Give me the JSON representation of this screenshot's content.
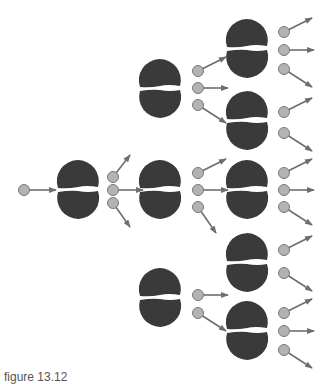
{
  "figure": {
    "caption": "figure 13.12",
    "colors": {
      "nucleus": "#3a3a3a",
      "neutron_fill": "#b3b3b3",
      "neutron_stroke": "#7a7a7a",
      "arrow": "#6e6e6e",
      "background": "#ffffff"
    }
  },
  "incoming_neutron": {
    "x": 24,
    "y": 190,
    "dx": 24,
    "dy": 0
  },
  "nuclei": [
    {
      "id": "gen1-n1",
      "cx": 78,
      "gap_y": 189,
      "neutrons": [
        {
          "x": 113,
          "y": 177,
          "dx": 9,
          "dy": -18
        },
        {
          "x": 113,
          "y": 190,
          "dx": 22,
          "dy": 0
        },
        {
          "x": 113,
          "y": 203,
          "dx": 9,
          "dy": 18
        }
      ]
    },
    {
      "id": "gen2-n1",
      "cx": 160,
      "gap_y": 88,
      "neutrons": [
        {
          "x": 198,
          "y": 71,
          "dx": 20,
          "dy": -10
        },
        {
          "x": 198,
          "y": 88,
          "dx": 22,
          "dy": 0
        },
        {
          "x": 198,
          "y": 105,
          "dx": 20,
          "dy": 12
        }
      ]
    },
    {
      "id": "gen2-n2",
      "cx": 160,
      "gap_y": 189,
      "neutrons": [
        {
          "x": 198,
          "y": 173,
          "dx": 20,
          "dy": -10
        },
        {
          "x": 198,
          "y": 190,
          "dx": 22,
          "dy": 0
        },
        {
          "x": 198,
          "y": 207,
          "dx": 10,
          "dy": 20
        }
      ]
    },
    {
      "id": "gen2-n3",
      "cx": 160,
      "gap_y": 297,
      "neutrons": [
        {
          "x": 198,
          "y": 295,
          "dx": 22,
          "dy": 0
        },
        {
          "x": 198,
          "y": 313,
          "dx": 20,
          "dy": 12
        }
      ]
    },
    {
      "id": "gen3-n1",
      "cx": 247,
      "gap_y": 48,
      "neutrons": [
        {
          "x": 284,
          "y": 32,
          "dx": 20,
          "dy": -10
        },
        {
          "x": 284,
          "y": 50,
          "dx": 22,
          "dy": 0
        },
        {
          "x": 284,
          "y": 69,
          "dx": 20,
          "dy": 12
        }
      ]
    },
    {
      "id": "gen3-n2",
      "cx": 247,
      "gap_y": 120,
      "neutrons": [
        {
          "x": 284,
          "y": 112,
          "dx": 20,
          "dy": -10
        },
        {
          "x": 284,
          "y": 133,
          "dx": 20,
          "dy": 12
        }
      ]
    },
    {
      "id": "gen3-n3",
      "cx": 247,
      "gap_y": 189,
      "neutrons": [
        {
          "x": 284,
          "y": 173,
          "dx": 20,
          "dy": -10
        },
        {
          "x": 284,
          "y": 190,
          "dx": 22,
          "dy": 0
        },
        {
          "x": 284,
          "y": 207,
          "dx": 20,
          "dy": 12
        }
      ]
    },
    {
      "id": "gen3-n4",
      "cx": 247,
      "gap_y": 262,
      "neutrons": [
        {
          "x": 284,
          "y": 250,
          "dx": 20,
          "dy": -10
        },
        {
          "x": 284,
          "y": 273,
          "dx": 20,
          "dy": 12
        }
      ]
    },
    {
      "id": "gen3-n5",
      "cx": 247,
      "gap_y": 330,
      "neutrons": [
        {
          "x": 284,
          "y": 313,
          "dx": 20,
          "dy": -10
        },
        {
          "x": 284,
          "y": 331,
          "dx": 22,
          "dy": 0
        },
        {
          "x": 284,
          "y": 350,
          "dx": 20,
          "dy": 12
        }
      ]
    }
  ]
}
